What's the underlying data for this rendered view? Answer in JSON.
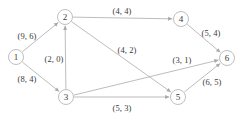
{
  "figure": {
    "type": "directed-graph",
    "background_color": "#ffffff",
    "node_fill_color": "#ffffff",
    "node_stroke_color": "#b8b8b8",
    "edge_color": "#b0b0b0",
    "text_color": "#3a3a3a",
    "width": 239,
    "height": 115
  },
  "chart_data": {
    "type": "diagram",
    "title": "",
    "nodes": [
      {
        "id": "1",
        "label": "1",
        "x": 16,
        "y": 57,
        "r": 7.5
      },
      {
        "id": "2",
        "label": "2",
        "x": 65,
        "y": 17,
        "r": 7.5
      },
      {
        "id": "3",
        "label": "3",
        "x": 66,
        "y": 97,
        "r": 7.5
      },
      {
        "id": "4",
        "label": "4",
        "x": 181,
        "y": 19,
        "r": 7.5
      },
      {
        "id": "5",
        "label": "5",
        "x": 178,
        "y": 97,
        "r": 7.5
      },
      {
        "id": "6",
        "label": "6",
        "x": 227,
        "y": 58,
        "r": 7.5
      }
    ],
    "edges": [
      {
        "from": "1",
        "to": "2",
        "label": "(9, 6)",
        "capacity": 9,
        "flow": 6,
        "label_x": 27,
        "label_y": 36
      },
      {
        "from": "1",
        "to": "3",
        "label": "(8, 4)",
        "capacity": 8,
        "flow": 4,
        "label_x": 27,
        "label_y": 79
      },
      {
        "from": "3",
        "to": "2",
        "label": "(2, 0)",
        "capacity": 2,
        "flow": 0,
        "label_x": 54,
        "label_y": 59
      },
      {
        "from": "2",
        "to": "4",
        "label": "(4, 4)",
        "capacity": 4,
        "flow": 4,
        "label_x": 122,
        "label_y": 11
      },
      {
        "from": "2",
        "to": "5",
        "label": "(4, 2)",
        "capacity": 4,
        "flow": 2,
        "label_x": 127,
        "label_y": 50
      },
      {
        "from": "3",
        "to": "6",
        "label": "(3, 1)",
        "capacity": 3,
        "flow": 1,
        "label_x": 182,
        "label_y": 60
      },
      {
        "from": "3",
        "to": "5",
        "label": "(5, 3)",
        "capacity": 5,
        "flow": 3,
        "label_x": 122,
        "label_y": 108
      },
      {
        "from": "4",
        "to": "6",
        "label": "(5, 4)",
        "capacity": 5,
        "flow": 4,
        "label_x": 211,
        "label_y": 33
      },
      {
        "from": "5",
        "to": "6",
        "label": "(6, 5)",
        "capacity": 6,
        "flow": 5,
        "label_x": 212,
        "label_y": 82
      }
    ]
  }
}
